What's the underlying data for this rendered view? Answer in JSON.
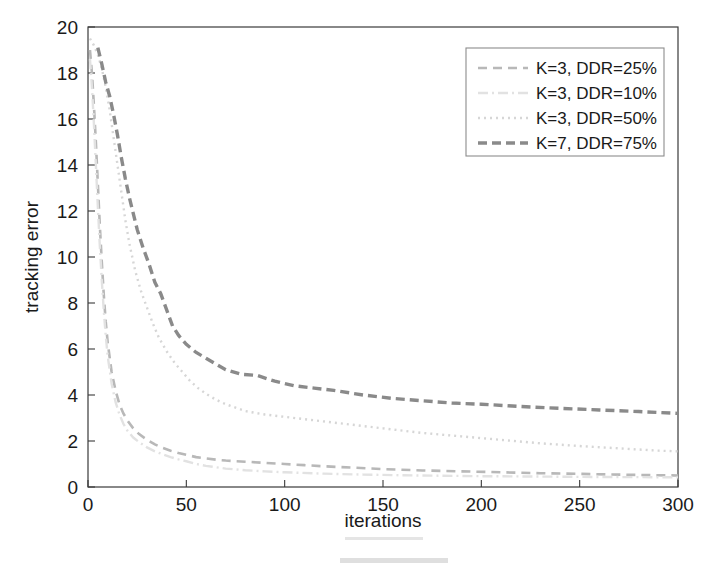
{
  "figure": {
    "background_color": "#ffffff",
    "width": 714,
    "height": 568
  },
  "chart_data": {
    "type": "line",
    "title": "",
    "xlabel": "iterations",
    "ylabel": "tracking error",
    "xlim": [
      0,
      300
    ],
    "ylim": [
      0,
      20
    ],
    "xticks": [
      0,
      50,
      100,
      150,
      200,
      250,
      300
    ],
    "yticks": [
      0,
      2,
      4,
      6,
      8,
      10,
      12,
      14,
      16,
      18,
      20
    ],
    "xtick_labels": [
      "0",
      "50",
      "100",
      "150",
      "200",
      "250",
      "300"
    ],
    "ytick_labels": [
      "0",
      "2",
      "4",
      "6",
      "8",
      "10",
      "12",
      "14",
      "16",
      "18",
      "20"
    ],
    "grid": false,
    "legend_position": "upper right",
    "series": [
      {
        "name": "K=3, DDR=25%",
        "label": "K=3, DDR=25%",
        "color": "#b8b8b8",
        "dash": "dashed",
        "dasharray": "9,6",
        "width": 2.6,
        "x": [
          1,
          2,
          3,
          4,
          5,
          6,
          7,
          8,
          9,
          10,
          12,
          14,
          16,
          18,
          20,
          23,
          26,
          30,
          34,
          38,
          42,
          46,
          50,
          55,
          60,
          65,
          70,
          80,
          90,
          100,
          110,
          120,
          135,
          150,
          170,
          190,
          210,
          230,
          250,
          270,
          290,
          300
        ],
        "y": [
          19.0,
          18.0,
          16.6,
          15.0,
          13.2,
          11.4,
          9.8,
          8.4,
          7.2,
          6.3,
          5.0,
          4.2,
          3.6,
          3.2,
          2.9,
          2.55,
          2.3,
          2.05,
          1.85,
          1.7,
          1.58,
          1.48,
          1.4,
          1.3,
          1.24,
          1.19,
          1.15,
          1.1,
          1.05,
          1.0,
          0.95,
          0.9,
          0.84,
          0.78,
          0.72,
          0.68,
          0.64,
          0.6,
          0.57,
          0.54,
          0.51,
          0.5
        ]
      },
      {
        "name": "K=3, DDR=10%",
        "label": "K=3, DDR=10%",
        "color": "#e2e2e2",
        "dash": "dashdot",
        "dasharray": "10,4,2,4",
        "width": 2.4,
        "x": [
          1,
          2,
          3,
          4,
          5,
          6,
          7,
          8,
          9,
          10,
          12,
          14,
          16,
          18,
          20,
          23,
          26,
          30,
          34,
          38,
          42,
          46,
          50,
          55,
          60,
          70,
          80,
          90,
          100,
          120,
          140,
          160,
          180,
          200,
          220,
          250,
          275,
          300
        ],
        "y": [
          18.6,
          17.4,
          15.8,
          14.0,
          12.2,
          10.5,
          9.0,
          7.7,
          6.6,
          5.7,
          4.5,
          3.7,
          3.15,
          2.75,
          2.45,
          2.15,
          1.95,
          1.72,
          1.55,
          1.42,
          1.3,
          1.2,
          1.12,
          1.0,
          0.92,
          0.8,
          0.73,
          0.68,
          0.64,
          0.58,
          0.54,
          0.51,
          0.49,
          0.47,
          0.46,
          0.44,
          0.43,
          0.42
        ]
      },
      {
        "name": "K=3, DDR=50%",
        "label": "K=3, DDR=50%",
        "color": "#d6d6d6",
        "dash": "dotted",
        "dasharray": "2,4",
        "width": 2.4,
        "x": [
          1,
          3,
          5,
          7,
          9,
          11,
          13,
          15,
          17,
          19,
          21,
          24,
          27,
          30,
          33,
          36,
          40,
          44,
          48,
          52,
          56,
          60,
          65,
          70,
          80,
          90,
          100,
          115,
          130,
          150,
          170,
          190,
          210,
          230,
          250,
          270,
          290,
          300
        ],
        "y": [
          19.5,
          19.2,
          18.8,
          18.2,
          17.4,
          16.4,
          15.2,
          14.0,
          12.8,
          11.6,
          10.6,
          9.4,
          8.5,
          7.8,
          7.1,
          6.5,
          5.9,
          5.4,
          5.0,
          4.6,
          4.3,
          4.05,
          3.8,
          3.6,
          3.3,
          3.15,
          3.05,
          2.9,
          2.75,
          2.55,
          2.35,
          2.2,
          2.05,
          1.9,
          1.78,
          1.68,
          1.58,
          1.55
        ]
      },
      {
        "name": "K=7, DDR=75%",
        "label": "K=7, DDR=75%",
        "color": "#8a8a8a",
        "dash": "dashed",
        "dasharray": "9,5",
        "width": 3.4,
        "x": [
          5,
          7,
          9,
          11,
          13,
          15,
          17,
          19,
          21,
          23,
          25,
          28,
          31,
          34,
          37,
          40,
          43,
          46,
          50,
          55,
          60,
          65,
          70,
          78,
          86,
          95,
          105,
          115,
          125,
          140,
          155,
          170,
          185,
          200,
          220,
          240,
          260,
          280,
          300
        ],
        "y": [
          19.1,
          18.4,
          17.6,
          17.0,
          16.2,
          15.3,
          14.3,
          13.4,
          12.6,
          11.9,
          11.2,
          10.4,
          9.7,
          8.9,
          8.4,
          7.7,
          7.0,
          6.6,
          6.2,
          5.85,
          5.6,
          5.35,
          5.1,
          4.9,
          4.85,
          4.6,
          4.4,
          4.3,
          4.2,
          4.0,
          3.85,
          3.75,
          3.65,
          3.6,
          3.5,
          3.42,
          3.35,
          3.28,
          3.2
        ]
      }
    ]
  },
  "legend": {
    "entries": [
      "K=3, DDR=25%",
      "K=3, DDR=10%",
      "K=3, DDR=50%",
      "K=7, DDR=75%"
    ]
  },
  "axes": {
    "x_title": "iterations",
    "y_title": "tracking error"
  }
}
